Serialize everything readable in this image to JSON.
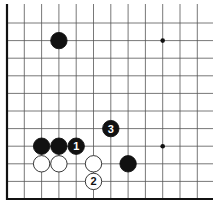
{
  "diagram": {
    "grid": {
      "origin_x": 7,
      "origin_y": 199,
      "spacing_x": 17.3,
      "spacing_y": 17.6,
      "cols": 12,
      "rows": 11,
      "extend_right": 213,
      "extend_top": 4,
      "line_color": "#555555",
      "edge_color": "#111111"
    },
    "hoshi": [
      {
        "col": 9,
        "row": 9
      },
      {
        "col": 9,
        "row": 3
      }
    ],
    "stones": [
      {
        "color": "black",
        "col": 3,
        "row": 9,
        "label": ""
      },
      {
        "color": "black",
        "col": 2,
        "row": 3,
        "label": ""
      },
      {
        "color": "black",
        "col": 3,
        "row": 3,
        "label": ""
      },
      {
        "color": "black",
        "col": 4,
        "row": 3,
        "label": "1"
      },
      {
        "color": "white",
        "col": 2,
        "row": 2,
        "label": ""
      },
      {
        "color": "white",
        "col": 3,
        "row": 2,
        "label": ""
      },
      {
        "color": "white",
        "col": 5,
        "row": 2,
        "label": ""
      },
      {
        "color": "white",
        "col": 5,
        "row": 1,
        "label": "2"
      },
      {
        "color": "black",
        "col": 6,
        "row": 4,
        "label": "3"
      },
      {
        "color": "black",
        "col": 7,
        "row": 2,
        "label": ""
      }
    ],
    "colors": {
      "black_stone": "#111111",
      "white_stone": "#ffffff",
      "white_outline": "#222222"
    }
  }
}
